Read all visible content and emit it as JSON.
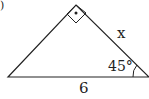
{
  "diagram": {
    "type": "right-triangle",
    "labels": {
      "base": "6",
      "hypotenuse_side": "x",
      "angle": "45°",
      "part_marker": ")"
    },
    "right_angle_marker": "square-with-dot",
    "colors": {
      "stroke": "#222222",
      "background": "#ffffff"
    }
  }
}
